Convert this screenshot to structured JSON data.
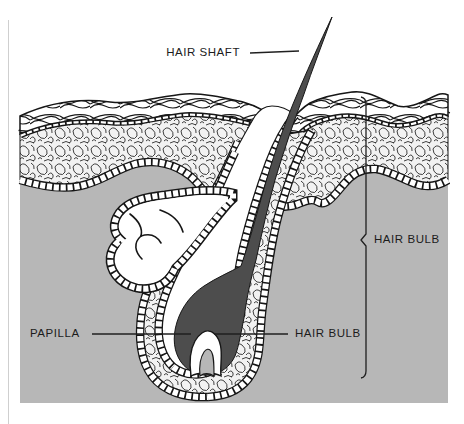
{
  "figure": {
    "kind": "anatomical-line-illustration"
  },
  "labels": {
    "hair_shaft": "HAIR SHAFT",
    "papilla": "PAPILLA",
    "hair_bulb_callout": "HAIR BULB",
    "hair_bulb_bracket": "HAIR BULB"
  },
  "colors": {
    "dermis": "#b7b7b7",
    "hair": "#4d4d4d",
    "tissue": "#f2f2f2",
    "outline": "#161616",
    "paper": "#ffffff"
  }
}
